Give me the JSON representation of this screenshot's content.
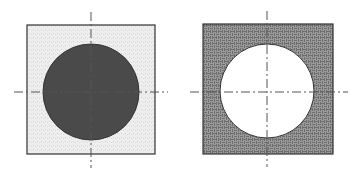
{
  "figure": {
    "panels": [
      {
        "name": "solid-circle-panel",
        "square": {
          "x": 27,
          "y": 25,
          "w": 128,
          "h": 129,
          "fill": "#ececec"
        },
        "circle": {
          "cx": 91,
          "cy": 92,
          "r": 48,
          "fill": "#4a4a4a"
        },
        "h_axis": {
          "x1": 14,
          "x2": 168,
          "y": 92
        },
        "v_axis": {
          "x": 91,
          "y1": 12,
          "y2": 168
        }
      },
      {
        "name": "hole-panel",
        "square": {
          "x": 203,
          "y": 24,
          "w": 130,
          "h": 130,
          "fill": "#8c8c8c"
        },
        "circle": {
          "cx": 267,
          "cy": 91,
          "r": 47,
          "fill": "#ffffff"
        },
        "h_axis": {
          "x1": 190,
          "x2": 348,
          "y": 92
        },
        "v_axis": {
          "x": 267,
          "y1": 11,
          "y2": 167
        }
      }
    ],
    "colors": {
      "outline": "#333333",
      "axis": "#555555",
      "light_fill": "#ececec",
      "dark_fill": "#4a4a4a",
      "hatch_fill": "#8c8c8c"
    }
  }
}
